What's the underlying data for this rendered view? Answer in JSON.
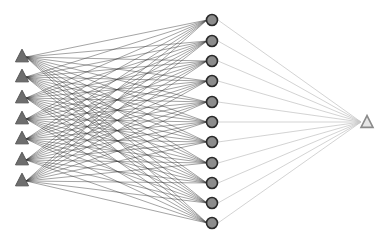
{
  "diagram": {
    "type": "neural-network",
    "layers": [
      {
        "name": "input",
        "shape": "triangle",
        "count": 7,
        "x": 22,
        "y": [
          56,
          76,
          97,
          118,
          138,
          159,
          180
        ]
      },
      {
        "name": "hidden",
        "shape": "circle",
        "count": 11,
        "x": 212,
        "y": [
          20,
          41,
          61,
          81,
          102,
          122,
          142,
          163,
          183,
          203,
          223
        ]
      },
      {
        "name": "output",
        "shape": "triangle-hollow",
        "count": 1,
        "x": 367,
        "y": [
          122
        ]
      }
    ],
    "colors": {
      "background": "#ffffff",
      "input_fill": "#6e6e6e",
      "input_stroke": "#555555",
      "hidden_fill": "#8c8c8c",
      "hidden_stroke": "#2a2a2a",
      "output_fill": "#e6e6e6",
      "output_stroke": "#8a8a8a",
      "edge_input_hidden": "#333333",
      "edge_hidden_output": "#c8c8c8"
    },
    "connectivity": "fully-connected"
  }
}
